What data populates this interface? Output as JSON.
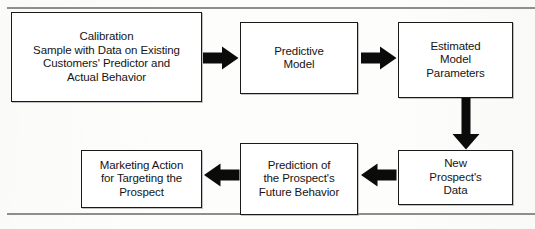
{
  "figure": {
    "background_color": "#fdfdfc",
    "line_color": "#1a1a1a",
    "rule_color": "#8e8e8e"
  },
  "nodes": {
    "calibration": {
      "label": "Calibration\nSample with Data on Existing\nCustomers' Predictor and\nActual Behavior"
    },
    "predictive_model": {
      "label": "Predictive\nModel"
    },
    "estimated_parameters": {
      "label": "Estimated\nModel\nParameters"
    },
    "new_prospects_data": {
      "label": "New\nProspect's\nData"
    },
    "prediction": {
      "label": "Prediction of\nthe Prospect's\nFuture Behavior"
    },
    "marketing_action": {
      "label": "Marketing Action\nfor Targeting the\nProspect"
    }
  },
  "arrows": [
    {
      "name": "calibration-to-predictive-model",
      "direction": "right"
    },
    {
      "name": "predictive-model-to-estimated-parameters",
      "direction": "right"
    },
    {
      "name": "estimated-parameters-to-new-prospects-data",
      "direction": "down"
    },
    {
      "name": "new-prospects-data-to-prediction",
      "direction": "left"
    },
    {
      "name": "prediction-to-marketing-action",
      "direction": "left"
    }
  ]
}
